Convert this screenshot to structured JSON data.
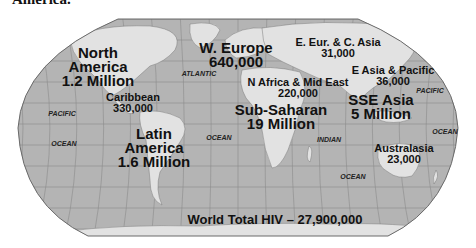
{
  "page_fragment": "America.",
  "map": {
    "title": "World Total HIV – 27,900,000",
    "colors": {
      "ocean": "#b4b4b4",
      "land": "#e2e2e2",
      "border": "#6a6a6a",
      "graticule": "#8c8c8c",
      "text": "#111111"
    },
    "regions": [
      {
        "id": "north-america",
        "lines": [
          "North",
          "America",
          "1.2 Million"
        ],
        "size": "big",
        "x": 98,
        "y": 46
      },
      {
        "id": "caribbean",
        "lines": [
          "Caribbean",
          "330,000"
        ],
        "size": "mid",
        "x": 133,
        "y": 92
      },
      {
        "id": "latin-america",
        "lines": [
          "Latin",
          "America",
          "1.6 Million"
        ],
        "size": "big",
        "x": 154,
        "y": 127
      },
      {
        "id": "western-europe",
        "lines": [
          "W. Europe",
          "640,000"
        ],
        "size": "big",
        "x": 236,
        "y": 41
      },
      {
        "id": "eastern-europe-central-asia",
        "lines": [
          "E. Eur. & C. Asia",
          "31,000"
        ],
        "size": "mid",
        "x": 338,
        "y": 37
      },
      {
        "id": "north-africa-middle-east",
        "lines": [
          "N Africa & Mid East",
          "220,000"
        ],
        "size": "mid",
        "x": 298,
        "y": 77
      },
      {
        "id": "east-asia-pacific",
        "lines": [
          "E Asia & Pacific",
          "36,000"
        ],
        "size": "mid",
        "x": 393,
        "y": 65
      },
      {
        "id": "south-southeast-asia",
        "lines": [
          "SSE Asia",
          "5 Million"
        ],
        "size": "big",
        "x": 381,
        "y": 93
      },
      {
        "id": "sub-saharan-africa",
        "lines": [
          "Sub-Saharan",
          "19 Million"
        ],
        "size": "big",
        "x": 281,
        "y": 103
      },
      {
        "id": "australasia",
        "lines": [
          "Australasia",
          "23,000"
        ],
        "size": "mid",
        "x": 404,
        "y": 143
      }
    ],
    "oceans": [
      {
        "id": "atlantic",
        "label": "ATLANTIC",
        "x": 199,
        "y": 70
      },
      {
        "id": "pacific-west",
        "label": "PACIFIC",
        "x": 62,
        "y": 110
      },
      {
        "id": "ocean-west",
        "label": "OCEAN",
        "x": 64,
        "y": 140
      },
      {
        "id": "ocean-atlantic-south",
        "label": "OCEAN",
        "x": 219,
        "y": 134
      },
      {
        "id": "indian",
        "label": "INDIAN",
        "x": 329,
        "y": 136
      },
      {
        "id": "ocean-indian",
        "label": "OCEAN",
        "x": 353,
        "y": 173
      },
      {
        "id": "pacific-east",
        "label": "PACIFIC",
        "x": 430,
        "y": 87
      },
      {
        "id": "ocean-east",
        "label": "OCEAN",
        "x": 445,
        "y": 128
      }
    ],
    "total_position": {
      "x": 275,
      "y": 212
    }
  }
}
